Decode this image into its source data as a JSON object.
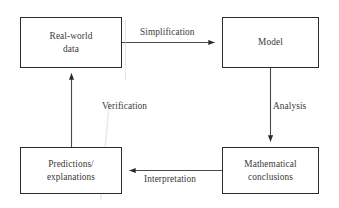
{
  "diagram": {
    "type": "flowchart",
    "background_color": "#ffffff",
    "stroke_color": "#2b2b2b",
    "text_color": "#3a3a3a",
    "nodes": [
      {
        "id": "real-world-data",
        "label": "Real-world\ndata"
      },
      {
        "id": "model",
        "label": "Model"
      },
      {
        "id": "math-conclusions",
        "label": "Mathematical\nconclusions"
      },
      {
        "id": "predictions",
        "label": "Predictions/\nexplanations"
      }
    ],
    "edges": [
      {
        "id": "simplification",
        "label": "Simplification",
        "from": "real-world-data",
        "to": "model",
        "direction": "right"
      },
      {
        "id": "analysis",
        "label": "Analysis",
        "from": "model",
        "to": "math-conclusions",
        "direction": "down"
      },
      {
        "id": "interpretation",
        "label": "Interpretation",
        "from": "math-conclusions",
        "to": "predictions",
        "direction": "left"
      },
      {
        "id": "verification",
        "label": "Verification",
        "from": "predictions",
        "to": "real-world-data",
        "direction": "up"
      }
    ]
  }
}
